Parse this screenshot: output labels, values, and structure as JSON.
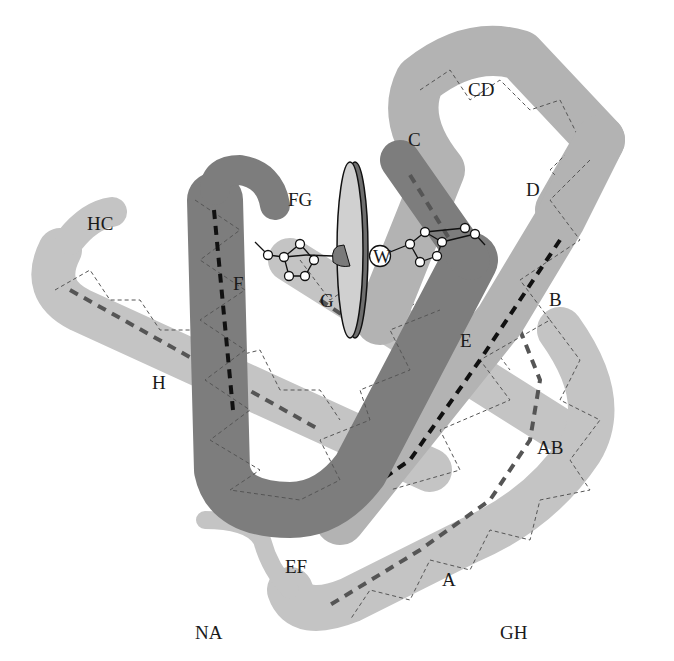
{
  "diagram": {
    "type": "protein-ribbon-globin-fold",
    "colors": {
      "light_helix": "#c4c4c4",
      "mid_helix": "#b3b3b3",
      "dark_helix": "#7d7d7d",
      "axis_dark": "#111111",
      "axis_mid": "#555555",
      "heme_face": "#d0d0d0",
      "heme_edge": "#6e6e6e"
    },
    "labels": {
      "CD": "CD",
      "C": "C",
      "D": "D",
      "FG": "FG",
      "HC": "HC",
      "F": "F",
      "G": "G",
      "W": "W",
      "B": "B",
      "E": "E",
      "H": "H",
      "AB": "AB",
      "EF": "EF",
      "A": "A",
      "NA": "NA",
      "GH": "GH"
    }
  }
}
